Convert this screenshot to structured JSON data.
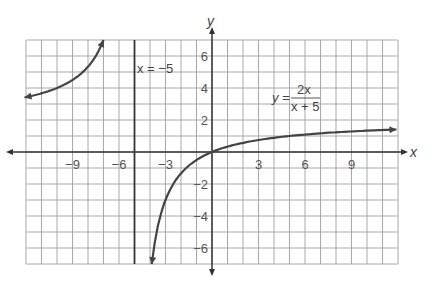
{
  "chart_data": {
    "type": "line",
    "title": "",
    "function": "y = 2x/(x+5)",
    "equation_label": {
      "lhs": "y =",
      "numerator": "2x",
      "denominator": "x + 5"
    },
    "asymptote_label": "x = −5",
    "vertical_asymptote": -5,
    "horizontal_asymptote": 2,
    "xlabel": "x",
    "ylabel": "y",
    "xlim": [
      -12,
      12
    ],
    "ylim": [
      -7,
      7
    ],
    "grid": true,
    "x_ticks": [
      -9,
      -6,
      -3,
      3,
      6,
      9
    ],
    "x_tick_labels": [
      "−9",
      "−6",
      "−3",
      "3",
      "6",
      "9"
    ],
    "y_ticks": [
      6,
      4,
      2,
      -2,
      -4,
      -6
    ],
    "y_tick_labels": [
      "6",
      "4",
      "2",
      "−2",
      "−4",
      "−6"
    ],
    "series": [
      {
        "name": "left branch",
        "x": [
          -12,
          -11,
          -10,
          -9,
          -8,
          -7.5,
          -7
        ],
        "y": [
          3.43,
          3.67,
          4.0,
          4.5,
          5.33,
          6.0,
          7.0
        ]
      },
      {
        "name": "right branch",
        "x": [
          -3.89,
          -3.5,
          -3,
          -2,
          -1,
          0,
          1,
          3,
          6,
          9,
          12
        ],
        "y": [
          -7.0,
          -4.67,
          -3.0,
          -1.33,
          -0.5,
          0,
          0.33,
          0.75,
          1.09,
          1.29,
          1.41
        ]
      }
    ]
  }
}
